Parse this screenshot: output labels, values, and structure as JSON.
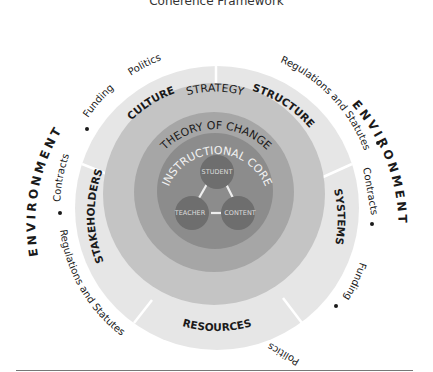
{
  "title": "Coherence Framework",
  "environment": {
    "label": "ENVIRONMENT",
    "left_arc": [
      "Regulations and Statutes",
      "Contracts",
      "Funding",
      "Politics"
    ],
    "right_arc": [
      "Regulations and Statutes",
      "Contracts",
      "Funding",
      "Politics"
    ]
  },
  "segments": [
    "CULTURE",
    "STRUCTURE",
    "SYSTEMS",
    "RESOURCES",
    "STAKEHOLDERS"
  ],
  "rings": {
    "strategy": "STRATEGY",
    "theory": "THEORY OF CHANGE",
    "core": "INSTRUCTIONAL CORE"
  },
  "nodes": {
    "student": "STUDENT",
    "teacher": "TEACHER",
    "content": "CONTENT"
  },
  "colors": {
    "outer": "#e6e6e6",
    "strategy": "#c4c4c4",
    "theory": "#a8a8a8",
    "core": "#8e8e8e",
    "node": "#6e6e6e",
    "text": "#1a1a1a"
  }
}
